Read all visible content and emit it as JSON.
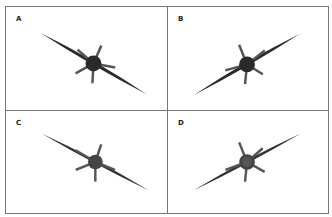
{
  "figure": {
    "panels": [
      {
        "id": "A",
        "label": "A",
        "bank": "left-wing-up",
        "angle": 30
      },
      {
        "id": "B",
        "label": "B",
        "bank": "right-wing-up",
        "angle": -30
      },
      {
        "id": "C",
        "label": "C",
        "bank": "left-wing-up",
        "angle": 30
      },
      {
        "id": "D",
        "label": "D",
        "bank": "right-wing-up",
        "angle": -30
      }
    ],
    "colors": {
      "border": "#777777",
      "aircraft": "#2a2a2a",
      "background": "#ffffff"
    }
  }
}
